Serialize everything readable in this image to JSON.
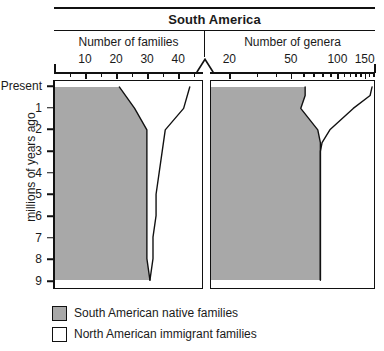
{
  "chart_data": {
    "type": "area",
    "title": "South America",
    "ylabel": "millions of years ago",
    "ylim": [
      0,
      9
    ],
    "y_tick_labels": [
      "Present",
      "1",
      "2",
      "3",
      "4",
      "5",
      "6",
      "7",
      "8",
      "9"
    ],
    "y_tick_values": [
      0,
      1,
      2,
      3,
      4,
      5,
      6,
      7,
      8,
      9
    ],
    "grid": false,
    "legend_position": "bottom-left",
    "legend": [
      {
        "label": "South American native families",
        "color": "#a8a8a8"
      },
      {
        "label": "North American immigrant families",
        "color": "#ffffff"
      }
    ],
    "panels": [
      {
        "name": "families",
        "xlabel": "Number of families",
        "xlim": [
          0,
          48
        ],
        "x_tick_labels": [
          "10",
          "20",
          "30",
          "40"
        ],
        "x_tick_values": [
          10,
          20,
          30,
          40
        ],
        "x_minor_step": 5,
        "scale": "linear",
        "series": [
          {
            "name": "South American native families",
            "points": [
              {
                "mya": 0,
                "value": 21
              },
              {
                "mya": 1,
                "value": 26
              },
              {
                "mya": 2,
                "value": 30
              },
              {
                "mya": 3,
                "value": 30
              },
              {
                "mya": 4,
                "value": 30
              },
              {
                "mya": 5,
                "value": 30
              },
              {
                "mya": 6,
                "value": 30
              },
              {
                "mya": 7,
                "value": 30
              },
              {
                "mya": 8,
                "value": 30
              },
              {
                "mya": 9,
                "value": 31
              }
            ]
          },
          {
            "name": "Total families (native + immigrant)",
            "points": [
              {
                "mya": 0,
                "value": 44
              },
              {
                "mya": 1,
                "value": 42
              },
              {
                "mya": 1.5,
                "value": 39
              },
              {
                "mya": 2,
                "value": 36
              },
              {
                "mya": 3,
                "value": 35
              },
              {
                "mya": 4,
                "value": 34
              },
              {
                "mya": 5,
                "value": 33
              },
              {
                "mya": 6,
                "value": 33
              },
              {
                "mya": 7,
                "value": 32
              },
              {
                "mya": 8,
                "value": 32
              },
              {
                "mya": 9,
                "value": 31
              }
            ]
          }
        ]
      },
      {
        "name": "genera",
        "xlabel": "Number of genera",
        "xlim": [
          15,
          175
        ],
        "x_tick_labels": [
          "20",
          "50",
          "100",
          "150"
        ],
        "x_tick_values": [
          20,
          50,
          100,
          150
        ],
        "scale": "log",
        "series": [
          {
            "name": "South American native genera",
            "points": [
              {
                "mya": 0,
                "value": 62
              },
              {
                "mya": 0.4,
                "value": 62
              },
              {
                "mya": 1,
                "value": 58
              },
              {
                "mya": 2,
                "value": 75
              },
              {
                "mya": 2.6,
                "value": 78
              },
              {
                "mya": 3,
                "value": 78
              },
              {
                "mya": 5,
                "value": 78
              },
              {
                "mya": 7,
                "value": 78
              },
              {
                "mya": 9,
                "value": 78
              }
            ]
          },
          {
            "name": "Total genera (native + immigrant)",
            "points": [
              {
                "mya": 0,
                "value": 170
              },
              {
                "mya": 0.4,
                "value": 165
              },
              {
                "mya": 1,
                "value": 128
              },
              {
                "mya": 2,
                "value": 90
              },
              {
                "mya": 2.6,
                "value": 80
              },
              {
                "mya": 3,
                "value": 78
              },
              {
                "mya": 5,
                "value": 78
              },
              {
                "mya": 7,
                "value": 78
              },
              {
                "mya": 9,
                "value": 78
              }
            ]
          }
        ]
      }
    ]
  },
  "title": {
    "text": "South America"
  },
  "panels": {
    "left_header": "Number of families",
    "right_header": "Number of genera"
  },
  "yaxis": {
    "title": "millions of years ago"
  },
  "legend": {
    "native_label": "South American native families",
    "immigrant_label": "North American immigrant families"
  },
  "colors": {
    "native_fill": "#a8a8a8",
    "immigrant_fill": "#ffffff",
    "line": "#111111"
  }
}
